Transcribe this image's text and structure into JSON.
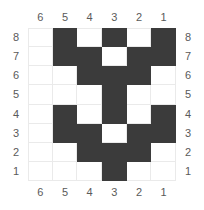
{
  "puzzle": {
    "title": "Nonogram Grid",
    "columns": 6,
    "rows": 8,
    "col_labels_top": [
      "6",
      "5",
      "4",
      "3",
      "2",
      "1"
    ],
    "col_labels_bottom": [
      "6",
      "5",
      "4",
      "3",
      "2",
      "1"
    ],
    "row_labels_left": [
      "8",
      "7",
      "6",
      "5",
      "4",
      "3",
      "2",
      "1"
    ],
    "row_labels_right": [
      "8",
      "7",
      "6",
      "5",
      "4",
      "3",
      "2",
      "1"
    ],
    "colors": {
      "filled": "#3b3b3b",
      "empty": "#ffffff",
      "gridline": "#eaeaea",
      "label": "#5a5a5a",
      "background": "#ffffff"
    },
    "cells": [
      [
        0,
        1,
        0,
        1,
        0,
        1
      ],
      [
        0,
        1,
        1,
        0,
        1,
        1
      ],
      [
        0,
        0,
        1,
        1,
        1,
        0
      ],
      [
        0,
        0,
        0,
        1,
        0,
        0
      ],
      [
        0,
        1,
        0,
        1,
        0,
        1
      ],
      [
        0,
        1,
        1,
        0,
        1,
        1
      ],
      [
        0,
        0,
        1,
        1,
        1,
        0
      ],
      [
        0,
        0,
        0,
        1,
        0,
        0
      ]
    ],
    "filled_by_row": {
      "8": [
        "5",
        "3",
        "1"
      ],
      "7": [
        "5",
        "4",
        "2",
        "1"
      ],
      "6": [
        "4",
        "3",
        "2"
      ],
      "5": [
        "3"
      ],
      "4": [
        "5",
        "3",
        "1"
      ],
      "3": [
        "5",
        "4",
        "2",
        "1"
      ],
      "2": [
        "4",
        "3",
        "2"
      ],
      "1": [
        "3"
      ]
    },
    "filled_count": 24
  }
}
